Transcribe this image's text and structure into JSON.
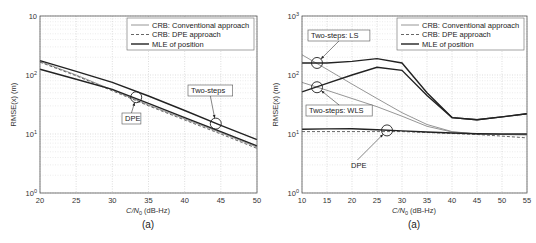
{
  "chart_data": [
    {
      "type": "line",
      "panel_label": "(a)",
      "title": "",
      "xlabel": "C/N0 (dB-Hz)",
      "ylabel": "RMSE(x) (m)",
      "yscale": "log",
      "xlim": [
        20,
        50
      ],
      "ylim": [
        1,
        1000
      ],
      "xticks": [
        20,
        25,
        30,
        35,
        40,
        45,
        50
      ],
      "yticks": [
        {
          "value": 1,
          "label": "10^0"
        },
        {
          "value": 10,
          "label": "10^1"
        },
        {
          "value": 100,
          "label": "10^2"
        },
        {
          "value": 1000,
          "label": "10"
        }
      ],
      "grid": true,
      "legend_position": "upper right",
      "legend": [
        "CRB: Conventional approach",
        "CRB: DPE approach",
        "MLE of position"
      ],
      "series": [
        {
          "name": "CRB: Conventional approach",
          "style": "solid-thin",
          "color": "#8a8a8a",
          "x": [
            20,
            25,
            30,
            35,
            40,
            45,
            50
          ],
          "y": [
            170,
            100,
            56,
            31,
            18,
            10.5,
            6.0
          ]
        },
        {
          "name": "CRB: DPE approach",
          "style": "dashed",
          "color": "#555555",
          "x": [
            20,
            25,
            30,
            35,
            40,
            45,
            50
          ],
          "y": [
            165,
            97,
            54,
            30,
            17.3,
            10.0,
            5.7
          ]
        },
        {
          "name": "MLE of position (DPE)",
          "style": "solid-thick",
          "color": "#222222",
          "x": [
            20,
            25,
            30,
            35,
            40,
            45,
            50
          ],
          "y": [
            125,
            85,
            57,
            33,
            19,
            11,
            6.3
          ]
        },
        {
          "name": "MLE of position (Two-steps)",
          "style": "solid-thick",
          "color": "#222222",
          "x": [
            20,
            25,
            30,
            35,
            40,
            45,
            50
          ],
          "y": [
            175,
            115,
            75,
            44,
            25,
            14,
            8.0
          ]
        }
      ],
      "annotations": [
        {
          "text": "DPE",
          "x": 33.3,
          "y": 42
        },
        {
          "text": "Two-steps",
          "x": 44.3,
          "y": 15
        }
      ]
    },
    {
      "type": "line",
      "panel_label": "(a)",
      "title": "",
      "xlabel": "C/N0 (dB-Hz)",
      "ylabel": "RMSE(x) (m)",
      "yscale": "log",
      "xlim": [
        10,
        55
      ],
      "ylim": [
        1,
        1000
      ],
      "xticks": [
        10,
        15,
        20,
        25,
        30,
        35,
        40,
        45,
        50,
        55
      ],
      "yticks": [
        {
          "value": 1,
          "label": "10^0"
        },
        {
          "value": 10,
          "label": "10^1"
        },
        {
          "value": 100,
          "label": "10^2"
        },
        {
          "value": 1000,
          "label": "10^3"
        }
      ],
      "grid": true,
      "legend_position": "upper right",
      "legend": [
        "CRB: Conventional approach",
        "CRB: DPE approach",
        "MLE of position"
      ],
      "series": [
        {
          "name": "CRB: Conventional approach (LS)",
          "style": "solid-thin",
          "color": "#8a8a8a",
          "x": [
            10,
            15,
            20,
            25,
            30,
            35,
            40,
            45,
            50,
            55
          ],
          "y": [
            220,
            125,
            70,
            40,
            23,
            14.5,
            11,
            10,
            9.8,
            9.7
          ]
        },
        {
          "name": "CRB: Conventional approach (WLS)",
          "style": "solid-thin",
          "color": "#8a8a8a",
          "x": [
            10,
            15,
            20,
            25,
            30,
            35,
            40,
            45,
            50,
            55
          ],
          "y": [
            75,
            55,
            40,
            29,
            20,
            13.5,
            10.8,
            10,
            9.8,
            9.7
          ]
        },
        {
          "name": "CRB: DPE approach",
          "style": "dashed",
          "color": "#555555",
          "x": [
            10,
            15,
            20,
            25,
            30,
            35,
            40,
            45,
            50,
            55
          ],
          "y": [
            11,
            11,
            11,
            11,
            11,
            10.6,
            10.2,
            9.8,
            9.2,
            8.6
          ]
        },
        {
          "name": "MLE of position (Two-steps: LS)",
          "style": "solid-thick",
          "color": "#222222",
          "x": [
            10,
            15,
            20,
            25,
            30,
            35,
            40,
            45,
            50,
            55
          ],
          "y": [
            160,
            160,
            170,
            190,
            160,
            50,
            19,
            17.5,
            19.5,
            22
          ]
        },
        {
          "name": "MLE of position (Two-steps: WLS)",
          "style": "solid-thick",
          "color": "#222222",
          "x": [
            10,
            15,
            20,
            25,
            30,
            35,
            40,
            45,
            50,
            55
          ],
          "y": [
            52,
            72,
            100,
            135,
            120,
            45,
            19,
            17.5,
            19.5,
            22
          ]
        },
        {
          "name": "MLE of position (DPE)",
          "style": "solid-thick",
          "color": "#222222",
          "x": [
            10,
            15,
            20,
            25,
            30,
            35,
            40,
            45,
            50,
            55
          ],
          "y": [
            12,
            12.2,
            12.3,
            11.8,
            11.3,
            10.8,
            10.4,
            10.1,
            10.0,
            10.0
          ]
        }
      ],
      "annotations": [
        {
          "text": "Two-steps: LS",
          "x": 13,
          "y": 160
        },
        {
          "text": "Two-steps: WLS",
          "x": 13,
          "y": 62
        },
        {
          "text": "DPE",
          "x": 27,
          "y": 11.5
        }
      ]
    }
  ],
  "labels": {
    "left_panel": "(a)",
    "right_panel": "(a)",
    "xlabel_prefix": "C/N",
    "xlabel_sub": "0",
    "xlabel_suffix": " (dB-Hz)",
    "ylabel": "RMSE(x) (m)",
    "legend": [
      "CRB: Conventional approach",
      "CRB: DPE approach",
      "MLE of position"
    ],
    "left_annotations": [
      "DPE",
      "Two-steps"
    ],
    "right_annotations": [
      "Two-steps: LS",
      "Two-steps: WLS",
      "DPE"
    ]
  }
}
